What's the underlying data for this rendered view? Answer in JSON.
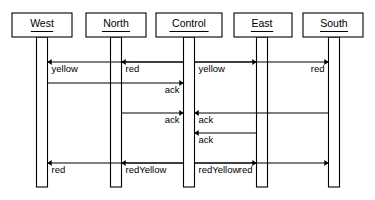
{
  "diagram": {
    "type": "uml-sequence-diagram",
    "background_color": "#ffffff",
    "line_color": "#000000",
    "width": 375,
    "height": 200,
    "lifelines": [
      {
        "id": "west",
        "label": "West",
        "x": 42,
        "box_x": 12,
        "box_w": 60
      },
      {
        "id": "north",
        "label": "North",
        "x": 116,
        "box_x": 86,
        "box_w": 60
      },
      {
        "id": "control",
        "label": "Control",
        "x": 189,
        "box_x": 156,
        "box_w": 66
      },
      {
        "id": "east",
        "label": "East",
        "x": 262,
        "box_x": 234,
        "box_w": 58
      },
      {
        "id": "south",
        "label": "South",
        "x": 334,
        "box_x": 303,
        "box_w": 60
      }
    ],
    "box": {
      "y": 13,
      "h": 24,
      "underline_pad": 9
    },
    "activation": {
      "top": 37,
      "bottom": 187,
      "width": 11
    },
    "messages": [
      {
        "id": "m1",
        "label": "yellow",
        "from": "control",
        "to": "west",
        "y": 62,
        "direction": "left",
        "label_anchor": "start",
        "arc_over": null
      },
      {
        "id": "m2",
        "label": "red",
        "from": "control",
        "to": "north",
        "y": 62,
        "direction": "left",
        "label_anchor": "start",
        "arc_over": "north"
      },
      {
        "id": "m3",
        "label": "yellow",
        "from": "control",
        "to": "east",
        "y": 62,
        "direction": "right",
        "label_anchor": "start",
        "arc_over": "east"
      },
      {
        "id": "m4",
        "label": "red",
        "from": "control",
        "to": "south",
        "y": 62,
        "direction": "right",
        "label_anchor": "end",
        "arc_over": null
      },
      {
        "id": "m5",
        "label": "ack",
        "from": "west",
        "to": "control",
        "y": 83,
        "direction": "right",
        "label_anchor": "end",
        "arc_over": null
      },
      {
        "id": "m6",
        "label": "ack",
        "from": "north",
        "to": "control",
        "y": 113,
        "direction": "right",
        "label_anchor": "end",
        "arc_over": null
      },
      {
        "id": "m7",
        "label": "ack",
        "from": "south",
        "to": "control",
        "y": 113,
        "direction": "left",
        "label_anchor": "start",
        "arc_over": null
      },
      {
        "id": "m8",
        "label": "ack",
        "from": "east",
        "to": "control",
        "y": 133,
        "direction": "left",
        "label_anchor": "start",
        "arc_over": null
      },
      {
        "id": "m9",
        "label": "red",
        "from": "control",
        "to": "west",
        "y": 163,
        "direction": "left",
        "label_anchor": "start",
        "arc_over": null
      },
      {
        "id": "m10",
        "label": "redYellow",
        "from": "control",
        "to": "north",
        "y": 163,
        "direction": "left",
        "label_anchor": "start",
        "arc_over": "north"
      },
      {
        "id": "m11",
        "label": "red",
        "from": "control",
        "to": "east",
        "y": 163,
        "direction": "right",
        "label_anchor": "end",
        "arc_over": "east"
      },
      {
        "id": "m12",
        "label": "redYellow",
        "from": "control",
        "to": "south",
        "y": 163,
        "direction": "right",
        "label_anchor": "start",
        "arc_over": null
      }
    ]
  }
}
